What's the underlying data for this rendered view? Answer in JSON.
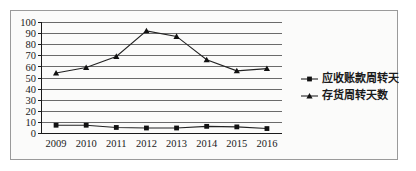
{
  "chart_data": {
    "type": "line",
    "title": "",
    "xlabel": "",
    "ylabel": "",
    "categories": [
      "2009",
      "2010",
      "2011",
      "2012",
      "2013",
      "2014",
      "2015",
      "2016"
    ],
    "ylim": [
      0,
      100
    ],
    "yticks": [
      "0",
      "10",
      "20",
      "30",
      "40",
      "50",
      "60",
      "70",
      "80",
      "90",
      "100"
    ],
    "grid": true,
    "legend_position": "right",
    "series": [
      {
        "name": "应收账款周转天数",
        "marker": "square",
        "values": [
          7,
          7,
          5,
          4.5,
          4.5,
          6,
          5.5,
          4
        ]
      },
      {
        "name": "存货周转天数",
        "marker": "triangle",
        "values": [
          54,
          59,
          69,
          92,
          87,
          66,
          56,
          58
        ]
      }
    ]
  },
  "legend": {
    "items": [
      {
        "label": "应收账款周转天数",
        "marker": "square"
      },
      {
        "label": "存货周转天数",
        "marker": "triangle"
      }
    ]
  }
}
